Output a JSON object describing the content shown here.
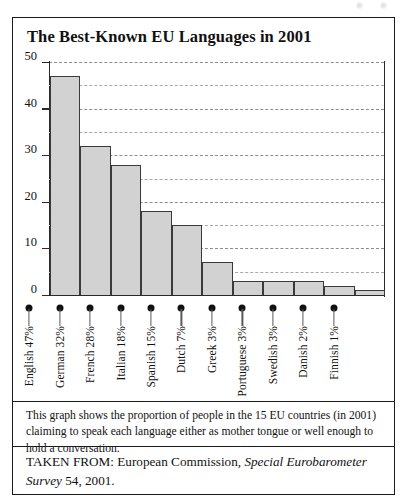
{
  "figure": {
    "title": "The Best-Known EU Languages in 2001",
    "caption": "This graph shows the proportion of people in the 15 EU countries (in 2001) claiming to speak each language either as mother tongue or well enough to hold a conversation.",
    "source_prefix": "TAKEN FROM: European Commission, ",
    "source_italic": "Special Eurobarometer Survey",
    "source_suffix": " 54, 2001."
  },
  "colors": {
    "bar_fill": "#d2d2d2",
    "bar_stroke": "#3a3a3a",
    "axis": "#2a2a2a",
    "grid": "#8d8d8d",
    "marker": "#111111",
    "frame": "#1b1b1b",
    "page_background": "#ffffff"
  },
  "chart_data": {
    "type": "bar",
    "title": "The Best-Known EU Languages in 2001",
    "xlabel": "",
    "ylabel": "",
    "ylim": [
      0,
      50
    ],
    "yticks": [
      0,
      10,
      20,
      30,
      40,
      50
    ],
    "ytick_labels": [
      "0",
      "10",
      "20",
      "30",
      "40",
      "50"
    ],
    "minor_gridlines": [
      5,
      15,
      25,
      35,
      45
    ],
    "grid": true,
    "legend": null,
    "units": "percent",
    "categories": [
      "English",
      "German",
      "French",
      "Italian",
      "Spanish",
      "Dutch",
      "Greek",
      "Portuguese",
      "Swedish",
      "Danish",
      "Finnish"
    ],
    "tick_labels": [
      "English 47%",
      "German 32%",
      "French 28%",
      "Italian 18%",
      "Spanish 15%",
      "Dutch 7%",
      "Greek 3%",
      "Portuguese 3%",
      "Swedish 3%",
      "Danish 2%",
      "Finnish 1%"
    ],
    "values": [
      47,
      32,
      28,
      18,
      15,
      7,
      3,
      3,
      3,
      2,
      1
    ]
  }
}
